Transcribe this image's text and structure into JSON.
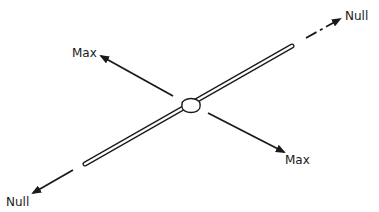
{
  "diagram": {
    "labels": {
      "null_top": "Null",
      "null_bottom": "Null",
      "max_left": "Max",
      "max_right": "Max"
    },
    "colors": {
      "arrow": "#1a1a1a",
      "rod_outline": "#1a1a1a",
      "rod_fill": "#ffffff"
    }
  }
}
